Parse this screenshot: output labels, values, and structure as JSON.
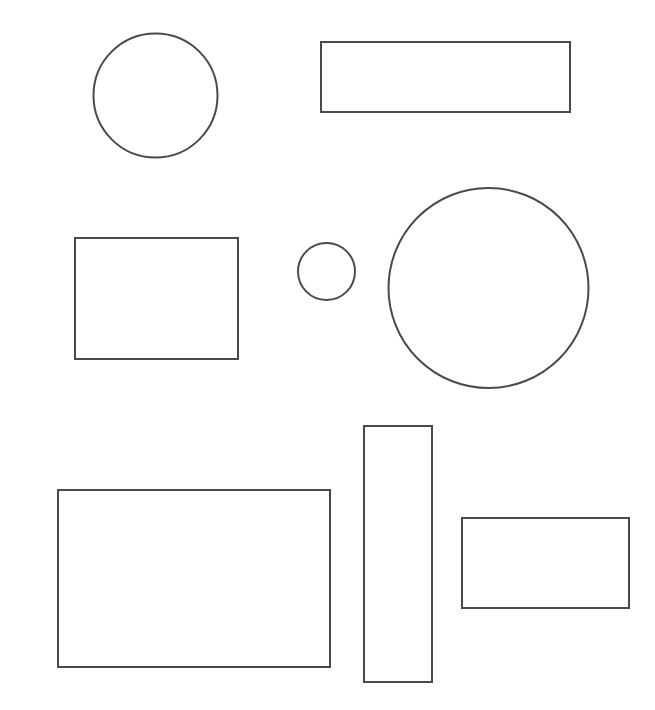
{
  "document": {
    "title": "Geometric Shapes Diagram",
    "width": 655,
    "height": 710,
    "background_color": "#ffffff"
  },
  "style": {
    "stroke_color": "#4a4a4a",
    "stroke_width": 2,
    "fill": "none"
  },
  "shapes": [
    {
      "id": "circle-top-left",
      "name": "circle",
      "label": "Circle",
      "cx": 155.5,
      "cy": 95.5,
      "r": 62,
      "stroke": "#4a4a4a",
      "stroke_width": 2,
      "fill": "none"
    },
    {
      "id": "rectangle-top-right",
      "name": "rectangle",
      "label": "Wide Rectangle",
      "x": 321,
      "y": 42,
      "width": 249,
      "height": 70,
      "stroke": "#4a4a4a",
      "stroke_width": 2,
      "fill": "none"
    },
    {
      "id": "rectangle-middle-left",
      "name": "rectangle",
      "label": "Medium Rectangle",
      "x": 75,
      "y": 238,
      "width": 163,
      "height": 121,
      "stroke": "#4a4a4a",
      "stroke_width": 2,
      "fill": "none"
    },
    {
      "id": "circle-small-center",
      "name": "circle",
      "label": "Small Circle",
      "cx": 326.5,
      "cy": 271.5,
      "r": 28.5,
      "stroke": "#4a4a4a",
      "stroke_width": 2,
      "fill": "none"
    },
    {
      "id": "circle-large-right",
      "name": "circle",
      "label": "Large Circle",
      "cx": 488.5,
      "cy": 288,
      "r": 100,
      "stroke": "#4a4a4a",
      "stroke_width": 2,
      "fill": "none"
    },
    {
      "id": "rectangle-bottom-left-large",
      "name": "rectangle",
      "label": "Large Rectangle",
      "x": 58,
      "y": 490,
      "width": 272,
      "height": 177,
      "stroke": "#4a4a4a",
      "stroke_width": 2,
      "fill": "none"
    },
    {
      "id": "rectangle-tall-vertical",
      "name": "rectangle",
      "label": "Tall Vertical Rectangle",
      "x": 364,
      "y": 426,
      "width": 68,
      "height": 256,
      "stroke": "#4a4a4a",
      "stroke_width": 2,
      "fill": "none"
    },
    {
      "id": "rectangle-bottom-right",
      "name": "rectangle",
      "label": "Bottom Right Rectangle",
      "x": 462,
      "y": 518,
      "width": 167,
      "height": 90,
      "stroke": "#4a4a4a",
      "stroke_width": 2,
      "fill": "none"
    }
  ],
  "summary": {
    "total_shapes": 8,
    "circle_count": 3,
    "rectangle_count": 5
  }
}
